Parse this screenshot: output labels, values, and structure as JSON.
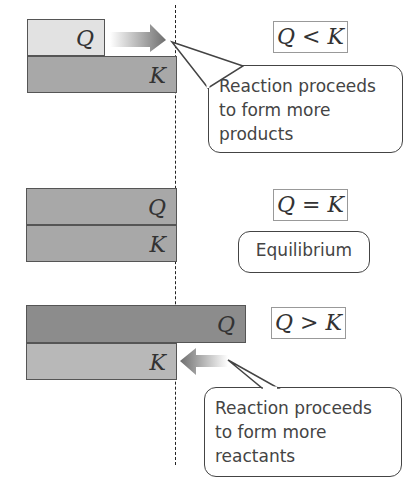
{
  "panels": [
    {
      "id": "q-less-than-k",
      "q_label": "Q",
      "k_label": "K",
      "comparison": {
        "left": "Q",
        "op": "<",
        "right": "K"
      },
      "callout": "Reaction proceeds to form more products",
      "arrow_direction": "right"
    },
    {
      "id": "q-equals-k",
      "q_label": "Q",
      "k_label": "K",
      "comparison": {
        "left": "Q",
        "op": "=",
        "right": "K"
      },
      "callout": "Equilibrium"
    },
    {
      "id": "q-greater-than-k",
      "q_label": "Q",
      "k_label": "K",
      "comparison": {
        "left": "Q",
        "op": ">",
        "right": "K"
      },
      "callout": "Reaction proceeds to form more reactants",
      "arrow_direction": "left"
    }
  ],
  "colors": {
    "q_small": "#e2e2e2",
    "k_bar": "#a8a8a8",
    "q_equal": "#a8a8a8",
    "q_large": "#8c8c8c",
    "k_light": "#b8b8b8"
  }
}
